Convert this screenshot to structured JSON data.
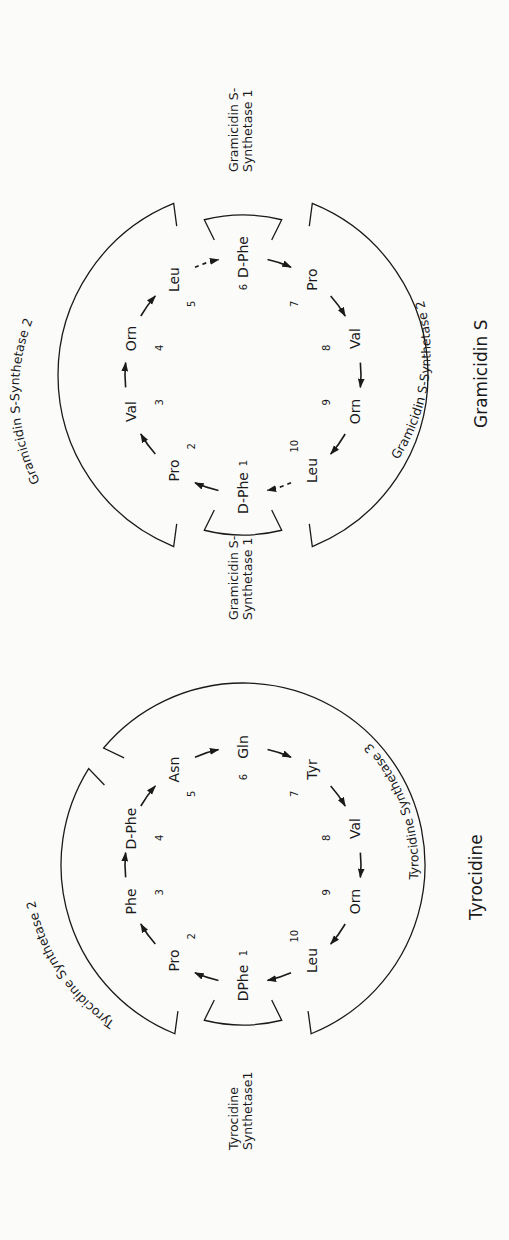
{
  "figure": {
    "panels": [
      {
        "id": "gramicidin",
        "title": "Gramicidin S",
        "residues": [
          {
            "pos": "1",
            "name": "D-Phe"
          },
          {
            "pos": "2",
            "name": "Pro"
          },
          {
            "pos": "3",
            "name": "Val"
          },
          {
            "pos": "4",
            "name": "Orn"
          },
          {
            "pos": "5",
            "name": "Leu"
          },
          {
            "pos": "6",
            "name": "D-Phe"
          },
          {
            "pos": "7",
            "name": "Pro"
          },
          {
            "pos": "8",
            "name": "Val"
          },
          {
            "pos": "9",
            "name": "Orn"
          },
          {
            "pos": "10",
            "name": "Leu"
          }
        ],
        "dashed_links": [
          [
            5,
            6
          ],
          [
            10,
            1
          ]
        ],
        "enzymes": [
          {
            "label_lines": [
              "Gramicidin S-",
              "Synthetase 1"
            ],
            "covers": [
              6
            ],
            "where": "top"
          },
          {
            "label_lines": [
              "Gramicidin S-",
              "Synthetase 1"
            ],
            "covers": [
              1
            ],
            "where": "bottom"
          },
          {
            "label_lines": [
              "Gramicidin S-Synthetase 2"
            ],
            "covers": [
              2,
              3,
              4,
              5
            ],
            "where": "left"
          },
          {
            "label_lines": [
              "Gramicidin S-Synthetase 2"
            ],
            "covers": [
              7,
              8,
              9,
              10
            ],
            "where": "right"
          }
        ]
      },
      {
        "id": "tyrocidine",
        "title": "Tyrocidine",
        "residues": [
          {
            "pos": "1",
            "name": "DPhe"
          },
          {
            "pos": "2",
            "name": "Pro"
          },
          {
            "pos": "3",
            "name": "Phe"
          },
          {
            "pos": "4",
            "name": "D-Phe"
          },
          {
            "pos": "5",
            "name": "Asn"
          },
          {
            "pos": "6",
            "name": "Gln"
          },
          {
            "pos": "7",
            "name": "Tyr"
          },
          {
            "pos": "8",
            "name": "Val"
          },
          {
            "pos": "9",
            "name": "Orn"
          },
          {
            "pos": "10",
            "name": "Leu"
          }
        ],
        "dashed_links": [],
        "enzymes": [
          {
            "label_lines": [
              "Tyrocidine",
              "Synthetase1"
            ],
            "covers": [
              1
            ],
            "where": "bottom"
          },
          {
            "label_lines": [
              "Tyrocidine Synthetase 2"
            ],
            "covers": [
              2,
              3,
              4
            ],
            "where": "left"
          },
          {
            "label_lines": [
              "Tyrocidine Synthetase 3"
            ],
            "covers": [
              5,
              6,
              7,
              8,
              9,
              10
            ],
            "where": "right"
          }
        ]
      }
    ]
  }
}
